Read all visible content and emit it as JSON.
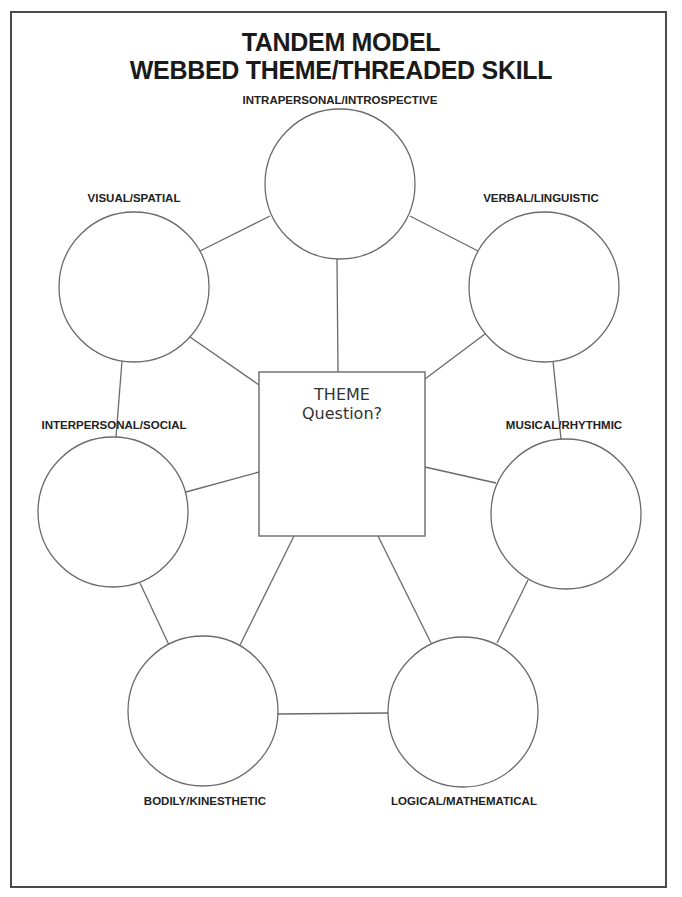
{
  "title": {
    "line1": "TANDEM MODEL",
    "line2": "WEBBED THEME/THREADED SKILL"
  },
  "center": {
    "line1": "THEME",
    "line2": "Question?"
  },
  "nodes": [
    {
      "id": "intrapersonal",
      "label": "INTRAPERSONAL/INTROSPECTIVE",
      "cx": 340,
      "cy": 184,
      "r": 75,
      "label_x": 340,
      "label_y": 94
    },
    {
      "id": "visual",
      "label": "VISUAL/SPATIAL",
      "cx": 134,
      "cy": 287,
      "r": 75,
      "label_x": 134,
      "label_y": 192
    },
    {
      "id": "verbal",
      "label": "VERBAL/LINGUISTIC",
      "cx": 544,
      "cy": 287,
      "r": 75,
      "label_x": 541,
      "label_y": 192
    },
    {
      "id": "interpersonal",
      "label": "INTERPERSONAL/SOCIAL",
      "cx": 113,
      "cy": 512,
      "r": 75,
      "label_x": 114,
      "label_y": 419
    },
    {
      "id": "musical",
      "label": "MUSICAL/RHYTHMIC",
      "cx": 566,
      "cy": 514,
      "r": 75,
      "label_x": 564,
      "label_y": 419
    },
    {
      "id": "bodily",
      "label": "BODILY/KINESTHETIC",
      "cx": 203,
      "cy": 711,
      "r": 75,
      "label_x": 205,
      "label_y": 795
    },
    {
      "id": "logical",
      "label": "LOGICAL/MATHEMATICAL",
      "cx": 463,
      "cy": 712,
      "r": 75,
      "label_x": 464,
      "label_y": 795
    }
  ],
  "square": {
    "x": 259,
    "y": 372,
    "w": 166,
    "h": 164
  },
  "connectors": [
    {
      "from": "intrapersonal",
      "to": "visual",
      "x1": 270,
      "y1": 216,
      "x2": 200,
      "y2": 251
    },
    {
      "from": "intrapersonal",
      "to": "verbal",
      "x1": 410,
      "y1": 216,
      "x2": 478,
      "y2": 251
    },
    {
      "from": "intrapersonal",
      "to": "theme",
      "x1": 337,
      "y1": 259,
      "x2": 338,
      "y2": 372
    },
    {
      "from": "visual",
      "to": "theme",
      "x1": 190,
      "y1": 337,
      "x2": 259,
      "y2": 385
    },
    {
      "from": "verbal",
      "to": "theme",
      "x1": 485,
      "y1": 334,
      "x2": 425,
      "y2": 379
    },
    {
      "from": "visual",
      "to": "interpersonal",
      "x1": 122,
      "y1": 361,
      "x2": 116,
      "y2": 437
    },
    {
      "from": "verbal",
      "to": "musical",
      "x1": 553,
      "y1": 361,
      "x2": 561,
      "y2": 439
    },
    {
      "from": "interpersonal",
      "to": "theme",
      "x1": 186,
      "y1": 492,
      "x2": 259,
      "y2": 472
    },
    {
      "from": "theme",
      "to": "musical",
      "x1": 425,
      "y1": 467,
      "x2": 496,
      "y2": 483
    },
    {
      "from": "interpersonal",
      "to": "bodily",
      "x1": 140,
      "y1": 583,
      "x2": 169,
      "y2": 645
    },
    {
      "from": "theme",
      "to": "bodily",
      "x1": 294,
      "y1": 536,
      "x2": 239,
      "y2": 647
    },
    {
      "from": "theme",
      "to": "logical",
      "x1": 378,
      "y1": 536,
      "x2": 431,
      "y2": 643
    },
    {
      "from": "musical",
      "to": "logical",
      "x1": 528,
      "y1": 580,
      "x2": 497,
      "y2": 643
    },
    {
      "from": "bodily",
      "to": "logical",
      "x1": 277,
      "y1": 714,
      "x2": 389,
      "y2": 713
    }
  ],
  "colors": {
    "stroke": "#6a6a6a",
    "frame": "#4a4a4a",
    "title_text": "#1a1a1a",
    "label_text": "#222222"
  }
}
